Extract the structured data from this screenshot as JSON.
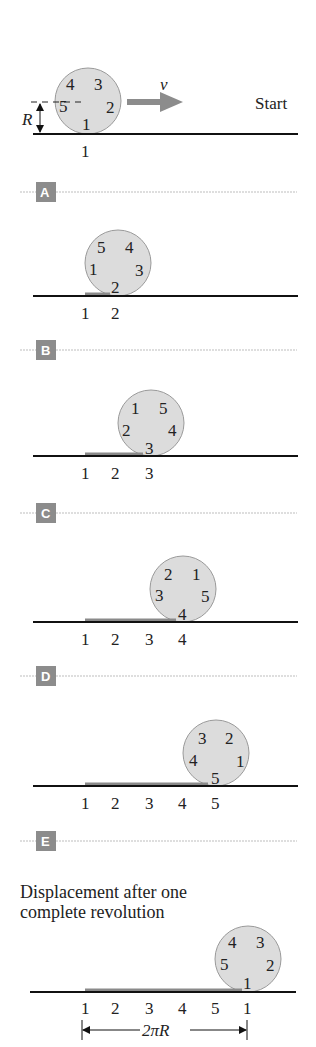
{
  "diagram": {
    "start_label": "Start",
    "velocity_symbol": "v",
    "radius_symbol": "R",
    "circumference_label": "2πR",
    "final_caption": [
      "Displacement after one",
      "complete revolution"
    ],
    "colors": {
      "wheel_fill": "#dcdcdc",
      "wheel_stroke": "#9a9a9a",
      "ground": "#111111",
      "trace": "#8a8a8a",
      "badge": "#8c8c8c",
      "divider": "#bdbdbd",
      "arrow": "#8c8c8c"
    },
    "panels": [
      {
        "id": "start",
        "wheel_numbers": [
          "4",
          "3",
          "5",
          "2",
          "1"
        ],
        "ground_labels": [
          "1"
        ]
      },
      {
        "id": "A",
        "badge": "A",
        "wheel_numbers": [
          "5",
          "4",
          "1",
          "3",
          "2"
        ],
        "ground_labels": [
          "1",
          "2"
        ]
      },
      {
        "id": "B",
        "badge": "B",
        "wheel_numbers": [
          "1",
          "5",
          "2",
          "4",
          "3"
        ],
        "ground_labels": [
          "1",
          "2",
          "3"
        ]
      },
      {
        "id": "C",
        "badge": "C",
        "wheel_numbers": [
          "2",
          "1",
          "3",
          "5",
          "4"
        ],
        "ground_labels": [
          "1",
          "2",
          "3",
          "4"
        ]
      },
      {
        "id": "D",
        "badge": "D",
        "wheel_numbers": [
          "3",
          "2",
          "4",
          "1",
          "5"
        ],
        "ground_labels": [
          "1",
          "2",
          "3",
          "4",
          "5"
        ]
      },
      {
        "id": "final",
        "badge": "E",
        "wheel_numbers": [
          "4",
          "3",
          "5",
          "2",
          "1"
        ],
        "ground_labels": [
          "1",
          "2",
          "3",
          "4",
          "5",
          "1"
        ]
      }
    ]
  }
}
